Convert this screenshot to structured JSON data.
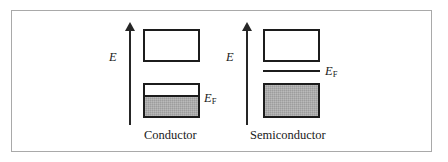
{
  "figure": {
    "type": "energy-band-diagram",
    "background_color": "#ffffff",
    "frame_color": "#a9a9a9",
    "line_color": "#1c1c1c",
    "fill_color": "#a9a9a9",
    "panels": [
      {
        "id": "conductor",
        "caption": "Conductor",
        "axis_label": "E",
        "fermi_label_main": "E",
        "fermi_label_sub": "F",
        "bands": [
          {
            "name": "conduction-band",
            "filled": false,
            "fill_fraction": 0
          },
          {
            "name": "valence-band",
            "filled": true,
            "fill_fraction": 0.55
          }
        ],
        "fermi_level_position": "inside-valence-band"
      },
      {
        "id": "semiconductor",
        "caption": "Semiconductor",
        "axis_label": "E",
        "fermi_label_main": "E",
        "fermi_label_sub": "F",
        "bands": [
          {
            "name": "conduction-band",
            "filled": false,
            "fill_fraction": 0
          },
          {
            "name": "valence-band",
            "filled": true,
            "fill_fraction": 1
          }
        ],
        "fermi_level_position": "in-band-gap"
      }
    ]
  }
}
